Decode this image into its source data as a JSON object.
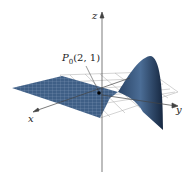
{
  "diagram": {
    "type": "3d-surface-plot",
    "axes": {
      "x": "x",
      "y": "y",
      "z": "z"
    },
    "point_label": "P",
    "point_subscript": "0",
    "point_coords": "(2, 1)",
    "colors": {
      "surface": "#3f5f86",
      "surface_dark": "#1f3350",
      "grid": "#9a9a9a",
      "axis": "#444444"
    }
  }
}
